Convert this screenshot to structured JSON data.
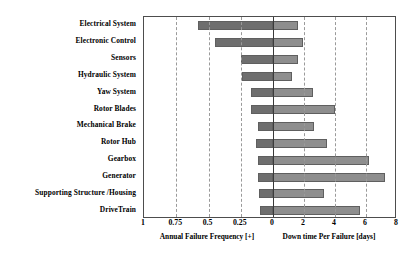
{
  "chart_data": {
    "type": "bar",
    "title": "",
    "subtitle": "",
    "orientation": "horizontal",
    "style": "butterfly-tornado",
    "grid": true,
    "legend_position": "none",
    "categories": [
      "Electrical System",
      "Electronic Control",
      "Sensors",
      "Hydraulic System",
      "Yaw System",
      "Rotor Blades",
      "Mechanical Brake",
      "Rotor Hub",
      "Gearbox",
      "Generator",
      "Supporting Structure /Housing",
      "DriveTrain"
    ],
    "series": [
      {
        "name": "Annual Failure Frequency [+]",
        "axis": "left",
        "direction": "left",
        "unit": "",
        "axis_label": "Annual Failure Frequency [+]",
        "axis_min": 0,
        "axis_max": 1,
        "axis_reversed": true,
        "ticks": [
          1,
          0.75,
          0.5,
          0.25,
          0
        ],
        "tick_labels": [
          "1",
          "0.75",
          "0.5",
          "0.25",
          "0"
        ],
        "color": "#6e6e6e",
        "values": [
          0.58,
          0.45,
          0.25,
          0.24,
          0.17,
          0.17,
          0.12,
          0.13,
          0.12,
          0.12,
          0.11,
          0.1
        ]
      },
      {
        "name": "Down time Per Failure [days]",
        "axis": "right",
        "direction": "right",
        "unit": "days",
        "axis_label": "Down time Per Failure [days]",
        "axis_min": 0,
        "axis_max": 8,
        "axis_reversed": false,
        "ticks": [
          0,
          2,
          4,
          6,
          8
        ],
        "tick_labels": [
          "0",
          "2",
          "4",
          "6",
          "8"
        ],
        "color": "#8e8e8e",
        "values": [
          1.6,
          1.95,
          1.6,
          1.2,
          2.6,
          4.0,
          2.65,
          3.5,
          6.2,
          7.2,
          3.3,
          5.6
        ]
      }
    ],
    "xlabel_left": "Annual Failure Frequency [+]",
    "xlabel_right": "Down time Per Failure [days]",
    "ylabel": ""
  },
  "axis": {
    "left_tick_labels": [
      "1",
      "0.75",
      "0.5",
      "0.25",
      "0"
    ],
    "right_tick_labels": [
      "2",
      "4",
      "6",
      "8"
    ],
    "left_title": "Annual Failure Frequency [+]",
    "right_title": "Down time Per Failure [days]"
  }
}
